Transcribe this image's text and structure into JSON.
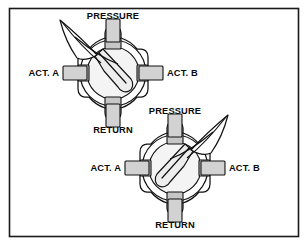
{
  "figure": {
    "background_color": "#ffffff",
    "border_color": "#1a1a1a",
    "line_color": "#111111",
    "metal_fill_color": "#d2d2d2",
    "bore_fill_color": "#f4f4f4"
  },
  "labels": {
    "pressure": "PRESSURE",
    "return": "RETURN",
    "actuator_a": "ACT. A",
    "actuator_b": "ACT. B"
  },
  "valves": [
    {
      "id": "valve-upper",
      "position_name": "position-1",
      "center_x": 113,
      "center_y": 73,
      "handle_direction": "up-left",
      "handle_angle_deg": 218,
      "rotor_flow": "upper-left-to-lower-right",
      "ports": {
        "top": "PRESSURE",
        "bottom": "RETURN",
        "left": "ACT. A",
        "right": "ACT. B"
      }
    },
    {
      "id": "valve-lower",
      "position_name": "position-2",
      "center_x": 175,
      "center_y": 168,
      "handle_direction": "up-right",
      "handle_angle_deg": 322,
      "rotor_flow": "upper-right-to-lower-left",
      "ports": {
        "top": "PRESSURE",
        "bottom": "RETURN",
        "left": "ACT. A",
        "right": "ACT. B"
      }
    }
  ]
}
